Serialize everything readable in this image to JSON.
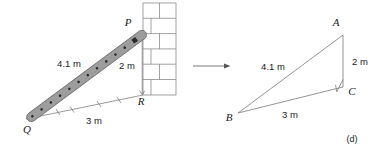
{
  "figure": {
    "caption": "(d)",
    "left_diagram": {
      "name": "ladder-against-wall",
      "vertex_labels": {
        "top": "P",
        "bottom_left": "Q",
        "bottom_right": "R"
      },
      "measurements": {
        "ladder_length": "4.1 m",
        "wall_height": "2 m",
        "ground_distance": "3 m"
      },
      "ladder": {
        "rung_count": 12,
        "fill_color": "#9d9d9d",
        "outline_color": "#5a5a5a"
      },
      "wall": {
        "brick_rows": 6,
        "line_color": "#8a8a8a"
      },
      "tick_marks": {
        "ground_ticks": 4,
        "description": "small angled tick marks along ground line"
      }
    },
    "right_diagram": {
      "name": "abstracted-right-triangle",
      "vertex_labels": {
        "top": "A",
        "bottom_left": "B",
        "right_angle": "C"
      },
      "measurements": {
        "hypotenuse": "4.1 m",
        "vertical_leg": "2 m",
        "horizontal_leg": "3 m"
      },
      "right_angle_marker": true,
      "line_color": "#7a7a7a"
    },
    "connector": {
      "name": "transition-arrow",
      "direction": "right",
      "color": "#555555"
    }
  }
}
